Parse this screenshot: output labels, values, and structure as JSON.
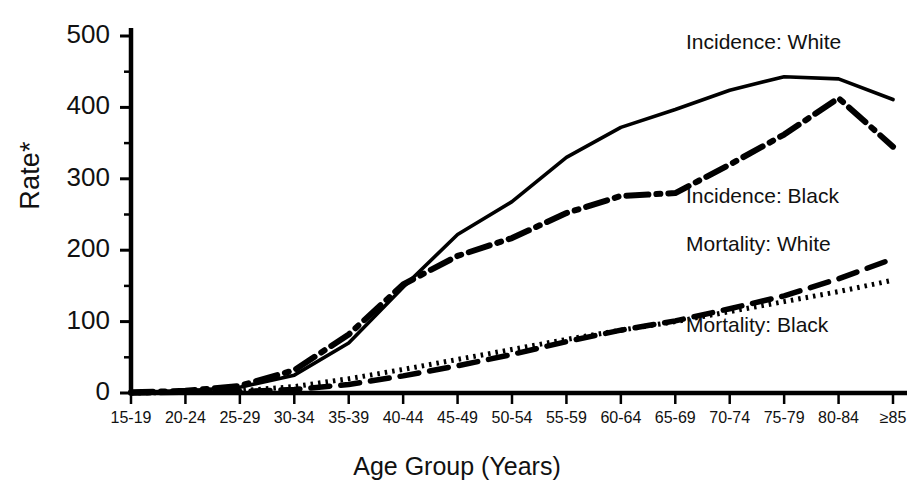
{
  "chart_data": {
    "type": "line",
    "title": "",
    "xlabel": "Age Group (Years)",
    "ylabel": "Rate*",
    "ylim": [
      0,
      500
    ],
    "yticks": [
      0,
      100,
      200,
      300,
      400,
      500
    ],
    "yminor_step": 50,
    "grid": false,
    "legend_position": "inline-right",
    "categories": [
      "15-19",
      "20-24",
      "25-29",
      "30-34",
      "35-39",
      "40-44",
      "45-49",
      "50-54",
      "55-59",
      "60-64",
      "65-69",
      "70-74",
      "75-79",
      "80-84",
      "≥85"
    ],
    "series": [
      {
        "name": "Incidence:  White",
        "style": "solid",
        "color": "#000000",
        "values": [
          1,
          3,
          8,
          25,
          70,
          148,
          222,
          268,
          330,
          372,
          397,
          424,
          443,
          440,
          411
        ]
      },
      {
        "name": "Incidence:  Black",
        "style": "dash-dot",
        "color": "#000000",
        "values": [
          1,
          3,
          10,
          32,
          82,
          152,
          192,
          217,
          252,
          276,
          280,
          320,
          362,
          413,
          345
        ]
      },
      {
        "name": "Mortality:  White",
        "style": "dashed",
        "color": "#000000",
        "values": [
          0,
          1,
          2,
          5,
          12,
          24,
          38,
          54,
          72,
          88,
          101,
          118,
          136,
          160,
          188
        ]
      },
      {
        "name": "Mortality:  Black",
        "style": "dotted",
        "color": "#000000",
        "values": [
          0,
          1,
          3,
          9,
          20,
          33,
          47,
          61,
          75,
          88,
          100,
          114,
          128,
          142,
          158
        ]
      }
    ]
  },
  "axis": {
    "y_tick_labels": [
      "0",
      "100",
      "200",
      "300",
      "400",
      "500"
    ],
    "x_tick_labels": [
      "15-19",
      "20-24",
      "25-29",
      "30-34",
      "35-39",
      "40-44",
      "45-49",
      "50-54",
      "55-59",
      "60-64",
      "65-69",
      "70-74",
      "75-79",
      "80-84",
      "≥85"
    ]
  },
  "labels": {
    "y_axis_title": "Rate*",
    "x_axis_title": "Age Group (Years)",
    "series_incidence_white": "Incidence:  White",
    "series_incidence_black": "Incidence:  Black",
    "series_mortality_white": "Mortality:  White",
    "series_mortality_black": "Mortality:  Black"
  }
}
